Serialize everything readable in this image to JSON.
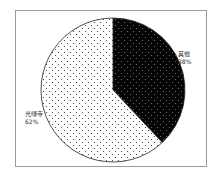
{
  "chart_data": {
    "type": "pie",
    "title": "",
    "slices": [
      {
        "label": "其他",
        "value": 38,
        "display": "38%",
        "fill": "#000000",
        "pattern": "dots-light"
      },
      {
        "label": "光绿寺",
        "value": 62,
        "display": "62%",
        "fill": "#ffffff",
        "pattern": "dots-dark"
      }
    ],
    "start_angle_deg": 0,
    "direction": "clockwise",
    "legend": "none",
    "labels_outside": true
  },
  "labels": {
    "right_name": "其他",
    "right_pct": "38%",
    "left_name": "光绿寺",
    "left_pct": "62%"
  }
}
